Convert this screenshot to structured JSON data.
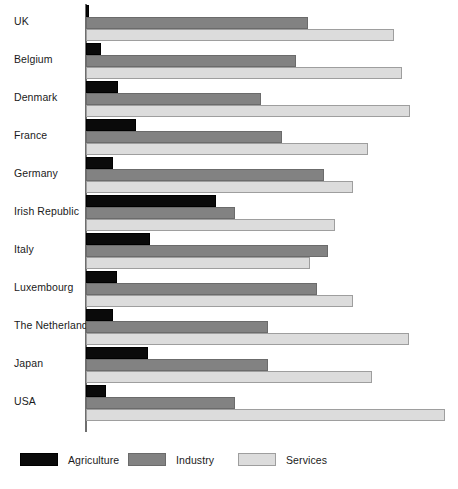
{
  "chart_data": {
    "type": "bar",
    "orientation": "horizontal",
    "title": "",
    "subtitle": "",
    "xlabel": "",
    "ylabel": "",
    "grid": false,
    "legend_position": "bottom",
    "xlim": [
      0,
      70
    ],
    "categories": [
      "UK",
      "Belgium",
      "Denmark",
      "France",
      "Germany",
      "Irish Republic",
      "Italy",
      "Luxembourg",
      "The Netherlands",
      "Japan",
      "USA"
    ],
    "series": [
      {
        "name": "Agriculture",
        "color": "#0a0a0a",
        "values": [
          1,
          3,
          6,
          10,
          5,
          25,
          12,
          6,
          5,
          12,
          4
        ]
      },
      {
        "name": "Industry",
        "color": "#828282",
        "values": [
          43,
          41,
          34,
          38,
          46,
          29,
          47,
          45,
          36,
          36,
          29
        ]
      },
      {
        "name": "Services",
        "color": "#dcdcdc",
        "values": [
          60,
          62,
          63,
          55,
          52,
          49,
          44,
          52,
          63,
          56,
          70
        ]
      }
    ],
    "bar_pixel_lengths": {
      "axis_x": 86,
      "px_per_unit": 5.13,
      "Agriculture": [
        3,
        15,
        32,
        50,
        27,
        130,
        64,
        31,
        27,
        62,
        20
      ],
      "Industry": [
        222,
        210,
        175,
        196,
        238,
        149,
        242,
        231,
        182,
        182,
        149
      ],
      "Services": [
        308,
        316,
        324,
        282,
        267,
        249,
        224,
        267,
        323,
        286,
        359
      ]
    }
  },
  "legend": {
    "items": [
      {
        "label": "Agriculture",
        "swatch": "agriculture-swatch"
      },
      {
        "label": "Industry",
        "swatch": "industry-swatch"
      },
      {
        "label": "Services",
        "swatch": "services-swatch"
      }
    ]
  }
}
